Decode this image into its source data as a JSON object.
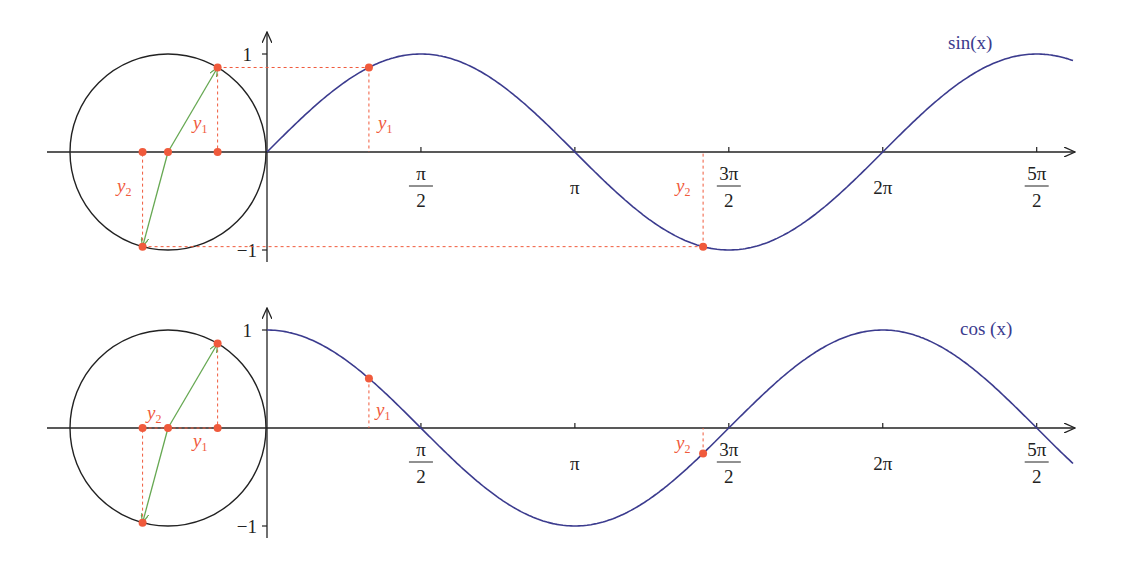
{
  "colors": {
    "curve": "#3b3b8e",
    "accent": "#f05a3c",
    "vector": "#66a852",
    "axis": "#222222"
  },
  "panels": [
    {
      "id": "sin",
      "function": "sin",
      "curve_label": "sin(x)",
      "y_tick_labels": [
        "1",
        "−1"
      ],
      "x_tick_labels": [
        {
          "num": "π",
          "den": "2"
        },
        {
          "num": "π",
          "den": ""
        },
        {
          "num": "3π",
          "den": "2"
        },
        {
          "num": "2π",
          "den": ""
        },
        {
          "num": "5π",
          "den": "2"
        }
      ],
      "annotations": {
        "y1": "y",
        "y1_sub": "1",
        "y2": "y",
        "y2_sub": "2"
      }
    },
    {
      "id": "cos",
      "function": "cos",
      "curve_label": "cos (x)",
      "y_tick_labels": [
        "1",
        "−1"
      ],
      "x_tick_labels": [
        {
          "num": "π",
          "den": "2"
        },
        {
          "num": "π",
          "den": ""
        },
        {
          "num": "3π",
          "den": "2"
        },
        {
          "num": "2π",
          "den": ""
        },
        {
          "num": "5π",
          "den": "2"
        }
      ],
      "annotations": {
        "y1": "y",
        "y1_sub": "1",
        "y2": "y",
        "y2_sub": "2"
      }
    }
  ],
  "chart_data": [
    {
      "type": "line",
      "title": "sin(x) with unit circle projection",
      "series": [
        {
          "name": "sin(x)",
          "x_range": [
            0,
            8.2
          ],
          "formula": "sin(x)"
        }
      ],
      "x_ticks": [
        "π/2",
        "π",
        "3π/2",
        "2π",
        "5π/2"
      ],
      "y_ticks": [
        "1",
        "-1"
      ],
      "ylim": [
        -1,
        1
      ],
      "marked_points": [
        {
          "label": "y1",
          "x": 1.04,
          "y": 0.86
        },
        {
          "label": "y2",
          "x": 4.45,
          "y": -0.97
        }
      ]
    },
    {
      "type": "line",
      "title": "cos(x) with unit circle projection",
      "series": [
        {
          "name": "cos(x)",
          "x_range": [
            0,
            8.2
          ],
          "formula": "cos(x)"
        }
      ],
      "x_ticks": [
        "π/2",
        "π",
        "3π/2",
        "2π",
        "5π/2"
      ],
      "y_ticks": [
        "1",
        "-1"
      ],
      "ylim": [
        -1,
        1
      ],
      "marked_points": [
        {
          "label": "y1",
          "x": 1.04,
          "y": 0.51
        },
        {
          "label": "y2",
          "x": 4.45,
          "y": -0.25
        }
      ]
    }
  ],
  "geometry": {
    "origin_x": 267,
    "scale": 98,
    "axis_end_x": 1075,
    "axis_start_x": 47,
    "curve_end_x": 1073,
    "circle_cx": 168,
    "theta1": 1.04,
    "theta2": 4.45,
    "panels_y": [
      152,
      428
    ]
  }
}
